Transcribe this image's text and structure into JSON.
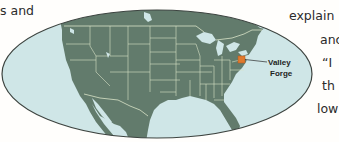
{
  "text_fragments": [
    {
      "id": "left-top",
      "text": "s  and"
    },
    {
      "id": "right-1",
      "text": "explain"
    },
    {
      "id": "right-2",
      "text": "anc"
    },
    {
      "id": "right-3",
      "text": "“I"
    },
    {
      "id": "right-4",
      "text": "th"
    },
    {
      "id": "right-5",
      "text": "low"
    }
  ],
  "map": {
    "location_label_line1": "Valley",
    "location_label_line2": "Forge",
    "marker_color": "#e07a2e",
    "land_color": "#627b6c",
    "water_color": "#cfe6e7",
    "border_color": "#d9e3c8",
    "outline_color": "#3d4440"
  }
}
